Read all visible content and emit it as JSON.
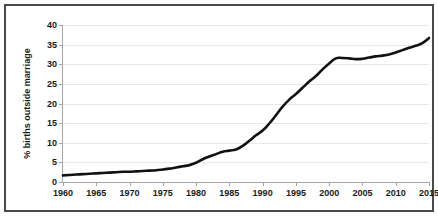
{
  "chart_data": {
    "type": "line",
    "title": "",
    "subtitle": "",
    "xlabel": "",
    "ylabel": "% births outside marriage",
    "xlim": [
      1960,
      2015
    ],
    "ylim": [
      0,
      40
    ],
    "grid": true,
    "legend": false,
    "legend_position": "none",
    "series_color": "#111111",
    "grid_color": "#e8e8e8",
    "axis_color": "#a6a6a6",
    "frame_color": "#4a4a4a",
    "xticks": [
      1960,
      1965,
      1970,
      1975,
      1980,
      1985,
      1990,
      1995,
      2000,
      2005,
      2010,
      2015
    ],
    "xtick_labels": [
      "1960",
      "1965",
      "1970",
      "1975",
      "1980",
      "1985",
      "1990",
      "1995",
      "2000",
      "2005",
      "2010",
      "2015"
    ],
    "yticks": [
      0,
      5,
      10,
      15,
      20,
      25,
      30,
      35,
      40
    ],
    "ytick_labels": [
      "0",
      "5",
      "10",
      "15",
      "20",
      "25",
      "30",
      "35",
      "40"
    ],
    "series": [
      {
        "name": "% births outside marriage",
        "x": [
          1960,
          1961,
          1962,
          1963,
          1964,
          1965,
          1966,
          1967,
          1968,
          1969,
          1970,
          1971,
          1972,
          1973,
          1974,
          1975,
          1976,
          1977,
          1978,
          1979,
          1980,
          1981,
          1982,
          1983,
          1984,
          1985,
          1986,
          1987,
          1988,
          1989,
          1990,
          1991,
          1992,
          1993,
          1994,
          1995,
          1996,
          1997,
          1998,
          1999,
          2000,
          2001,
          2002,
          2003,
          2004,
          2005,
          2006,
          2007,
          2008,
          2009,
          2010,
          2011,
          2012,
          2013,
          2014,
          2015
        ],
        "values": [
          1.7,
          1.8,
          1.9,
          2.0,
          2.1,
          2.2,
          2.3,
          2.4,
          2.5,
          2.6,
          2.6,
          2.7,
          2.8,
          2.9,
          3.0,
          3.2,
          3.4,
          3.7,
          4.0,
          4.3,
          4.9,
          5.8,
          6.5,
          7.1,
          7.7,
          8.0,
          8.3,
          9.2,
          10.5,
          11.9,
          13.1,
          14.9,
          17.0,
          19.2,
          21.0,
          22.4,
          24.0,
          25.6,
          27.0,
          28.7,
          30.2,
          31.5,
          31.6,
          31.5,
          31.3,
          31.4,
          31.7,
          32.0,
          32.2,
          32.5,
          33.0,
          33.6,
          34.2,
          34.7,
          35.4,
          36.7
        ]
      }
    ]
  },
  "axis": {
    "y_title": "% births outside marriage"
  }
}
